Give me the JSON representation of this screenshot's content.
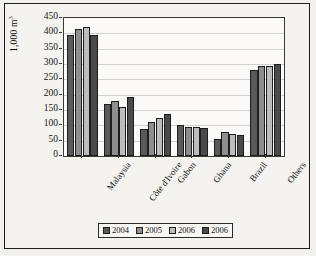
{
  "chart_data": {
    "type": "bar",
    "title": "",
    "xlabel": "",
    "ylabel": "1,000 m",
    "ylabel_superscript": "3",
    "ylim": [
      0,
      450
    ],
    "ytick_step": 50,
    "ytick_labels": [
      "450",
      "400",
      "350",
      "300",
      "250",
      "200",
      "150",
      "100",
      "50",
      "0"
    ],
    "grid": true,
    "legend_position": "bottom",
    "categories": [
      "Malaysia",
      "Côte d'Ivoire",
      "Gabon",
      "Ghana",
      "Brazil",
      "Others"
    ],
    "series": [
      {
        "name": "2004",
        "color": "#5a5a5a",
        "values": [
          395,
          168,
          87,
          102,
          57,
          282
        ]
      },
      {
        "name": "2005",
        "color": "#8e8e8e",
        "values": [
          415,
          180,
          112,
          96,
          78,
          292
        ]
      },
      {
        "name": "2006",
        "color": "#bdbdbd",
        "values": [
          420,
          160,
          123,
          95,
          72,
          295
        ]
      },
      {
        "name": "2006",
        "color": "#4a4a4a",
        "values": [
          395,
          192,
          138,
          90,
          70,
          300
        ]
      }
    ]
  }
}
